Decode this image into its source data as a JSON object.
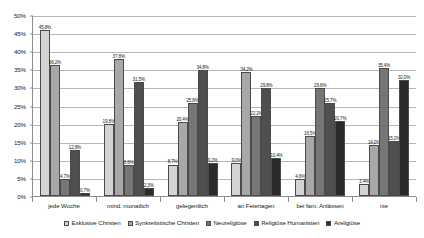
{
  "chart_data": {
    "type": "bar",
    "title": "",
    "subtitle": "",
    "xlabel": "",
    "ylabel": "",
    "ylim": [
      0,
      50
    ],
    "ytick_step": 5,
    "ytick_labels": [
      "50%",
      "45%",
      "40%",
      "35%",
      "30%",
      "25%",
      "20%",
      "15%",
      "10%",
      "5%",
      "0%"
    ],
    "grid": true,
    "legend_position": "bottom",
    "value_suffix": "%",
    "categories": [
      "jede Woche",
      "mind. monatlich",
      "gelegentlich",
      "an Feiertagen",
      "bei fam. Anlässen",
      "nie"
    ],
    "series": [
      {
        "name": "Exklusive Christen",
        "color": "#d4d4d4",
        "values": [
          45.8,
          19.8,
          8.7,
          9.0,
          4.6,
          3.4
        ],
        "labels": [
          "45,8%",
          "19,8%",
          "8,7%",
          "9,0%",
          "4,6%",
          "3,4%"
        ]
      },
      {
        "name": "Synkretistische Christen",
        "color": "#a8a8a8",
        "values": [
          36.2,
          37.8,
          20.4,
          34.2,
          16.5,
          14.0
        ],
        "labels": [
          "36,2%",
          "37,8%",
          "20,4%",
          "34,2%",
          "16,5%",
          "14,0%"
        ]
      },
      {
        "name": "Neureligiöse",
        "color": "#767676",
        "values": [
          4.7,
          8.6,
          25.8,
          22.2,
          29.8,
          35.4
        ],
        "labels": [
          "4,7%",
          "8,6%",
          "25,8%",
          "22,2%",
          "29,8%",
          "35,4%"
        ]
      },
      {
        "name": "Religiöse Humanisten",
        "color": "#4f4f4f",
        "values": [
          12.8,
          31.5,
          34.8,
          29.8,
          25.7,
          15.2
        ],
        "labels": [
          "12,8%",
          "31,5%",
          "34,8%",
          "29,8%",
          "25,7%",
          "15,2%"
        ]
      },
      {
        "name": "Areligiöse",
        "color": "#2b2b2b",
        "values": [
          0.7,
          2.3,
          9.2,
          10.4,
          20.7,
          32.0
        ],
        "labels": [
          "0,7%",
          "2,3%",
          "9,2%",
          "10,4%",
          "20,7%",
          "32,0%"
        ]
      }
    ]
  }
}
